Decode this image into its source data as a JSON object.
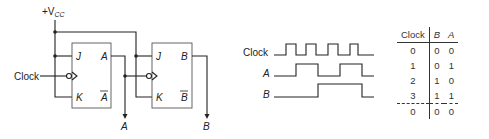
{
  "circuit": {
    "supply_label": "+V",
    "supply_subscript": "CC",
    "clock_input_label": "Clock",
    "flipflops": [
      {
        "name": "FF-A",
        "inputs": [
          "J",
          "K"
        ],
        "outputs": [
          "A",
          "A"
        ],
        "output_label": "A"
      },
      {
        "name": "FF-B",
        "inputs": [
          "J",
          "K"
        ],
        "outputs": [
          "B",
          "B"
        ],
        "output_label": "B"
      }
    ],
    "ff1": {
      "j": "J",
      "k": "K",
      "q": "A",
      "qbar": "A"
    },
    "ff2": {
      "j": "J",
      "k": "K",
      "q": "B",
      "qbar": "B"
    },
    "out_a": "A",
    "out_b": "B"
  },
  "timing": {
    "labels": {
      "clock": "Clock",
      "a": "A",
      "b": "B"
    }
  },
  "truth_table": {
    "headers": [
      "Clock",
      "B",
      "A"
    ],
    "rows": [
      [
        "0",
        "0",
        "0"
      ],
      [
        "1",
        "0",
        "1"
      ],
      [
        "2",
        "1",
        "0"
      ],
      [
        "3",
        "1",
        "1"
      ],
      [
        "0",
        "0",
        "0"
      ]
    ]
  }
}
